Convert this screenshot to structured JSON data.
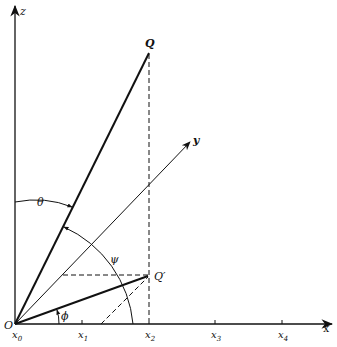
{
  "figure": {
    "type": "3D vector projection diagram",
    "axes": {
      "z": "z",
      "y": "y",
      "x": "x"
    },
    "points": {
      "origin": "O",
      "Q": "Q",
      "Q_prime": "Q′"
    },
    "angles": {
      "theta": "θ",
      "psi": "ψ",
      "phi": "ϕ"
    },
    "x_ticks": [
      {
        "label": "x",
        "sub": "0"
      },
      {
        "label": "x",
        "sub": "1"
      },
      {
        "label": "x",
        "sub": "2"
      },
      {
        "label": "x",
        "sub": "3"
      },
      {
        "label": "x",
        "sub": "4"
      }
    ]
  }
}
